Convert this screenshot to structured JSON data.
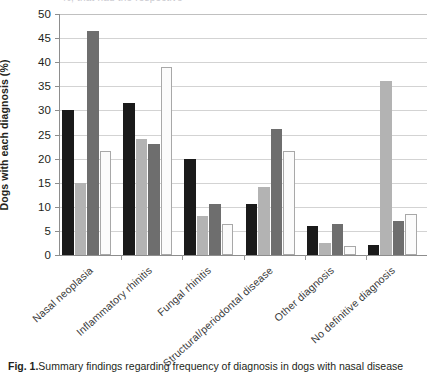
{
  "top_text": "%, that had the respective",
  "chart_data": {
    "type": "bar",
    "title": "",
    "subtitle": "",
    "xlabel": "",
    "ylabel": "Dogs with each diagnosis (%)",
    "ylim": [
      0,
      50
    ],
    "ytick_step": 5,
    "yticks": [
      "0",
      "5",
      "10",
      "15",
      "20",
      "25",
      "30",
      "35",
      "40",
      "45",
      "50"
    ],
    "grid": true,
    "legend_position": "none",
    "categories": [
      "Nasal neoplasia",
      "Inflammatory rhinitis",
      "Fungal rhinitis",
      "Structural/periodontal disease",
      "Other diagnosis",
      "No definitive diagnosis"
    ],
    "series": [
      {
        "name": "Series 1",
        "color": "#1a1a1a",
        "values": [
          30.0,
          31.6,
          20.0,
          10.6,
          6.0,
          2.0
        ]
      },
      {
        "name": "Series 2",
        "color": "#b3b3b3",
        "values": [
          15.0,
          24.0,
          8.0,
          14.2,
          2.5,
          36.0
        ]
      },
      {
        "name": "Series 3",
        "color": "#6e6e6e",
        "values": [
          46.5,
          23.0,
          10.5,
          26.2,
          6.5,
          7.0
        ]
      },
      {
        "name": "Series 4",
        "color": "#fbfbfb",
        "values": [
          21.5,
          39.0,
          6.5,
          21.5,
          1.8,
          8.5
        ]
      }
    ]
  },
  "caption": {
    "figure_label": "Fig. 1.",
    "text": "Summary findings regarding frequency of diagnosis in dogs with nasal disease"
  }
}
